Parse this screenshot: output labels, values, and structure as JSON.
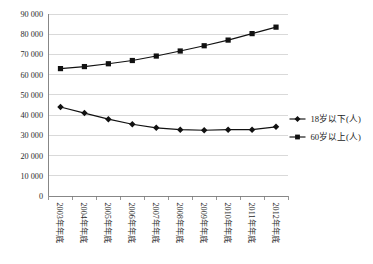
{
  "chart_data": {
    "type": "line",
    "title": "",
    "xlabel": "",
    "ylabel": "",
    "grid": true,
    "legend_position": "right",
    "ylim": [
      0,
      90000
    ],
    "ytick_labels": [
      "90 000",
      "80 000",
      "70 000",
      "60 000",
      "50 000",
      "40 000",
      "30 000",
      "20 000",
      "10 000",
      "0"
    ],
    "ytick_values": [
      90000,
      80000,
      70000,
      60000,
      50000,
      40000,
      30000,
      20000,
      10000,
      0
    ],
    "categories": [
      "2003年年底",
      "2004年年底",
      "2005年年底",
      "2006年年底",
      "2007年年底",
      "2008年年底",
      "2009年年底",
      "2010年年底",
      "2011年年底",
      "2012年年底"
    ],
    "series": [
      {
        "name": "18岁以下(人)",
        "marker": "diamond",
        "color": "#111111",
        "values": [
          44000,
          41000,
          38000,
          35500,
          33700,
          32800,
          32500,
          32800,
          32800,
          34200
        ]
      },
      {
        "name": "60岁以上(人)",
        "marker": "square",
        "color": "#111111",
        "values": [
          63000,
          64000,
          65400,
          67000,
          69200,
          71700,
          74300,
          77100,
          80300,
          83500
        ]
      }
    ]
  },
  "legend": {
    "items": [
      {
        "label": "18岁以下(人)",
        "marker": "diamond"
      },
      {
        "label": "60岁以上(人)",
        "marker": "square"
      }
    ]
  }
}
